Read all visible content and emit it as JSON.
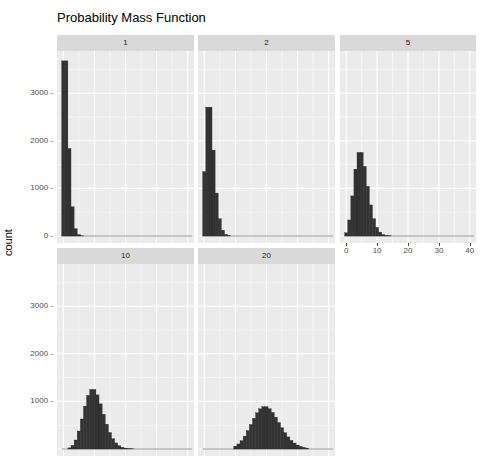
{
  "chart_data": {
    "type": "bar",
    "title": "Probability Mass Function",
    "xlabel": "",
    "ylabel": "count",
    "facets": [
      "1",
      "2",
      "5",
      "10",
      "20"
    ],
    "ylim": [
      0,
      3900
    ],
    "y_ticks": [
      0,
      1000,
      2000,
      3000
    ],
    "xlim": [
      -2,
      42
    ],
    "x_ticks": [
      0,
      10,
      20,
      30,
      40
    ],
    "grid": true,
    "bin_width": 1,
    "series": [
      {
        "name": "1",
        "x": [
          0,
          1,
          2,
          3,
          4,
          5,
          6
        ],
        "values": [
          3679,
          3679,
          1839,
          613,
          153,
          31,
          5
        ]
      },
      {
        "name": "2",
        "x": [
          0,
          1,
          2,
          3,
          4,
          5,
          6,
          7,
          8
        ],
        "values": [
          1353,
          2707,
          2707,
          1804,
          902,
          361,
          120,
          34,
          9
        ]
      },
      {
        "name": "5",
        "x": [
          0,
          1,
          2,
          3,
          4,
          5,
          6,
          7,
          8,
          9,
          10,
          11,
          12,
          13,
          14
        ],
        "values": [
          67,
          337,
          842,
          1404,
          1755,
          1755,
          1462,
          1044,
          653,
          363,
          181,
          82,
          34,
          13,
          5
        ]
      },
      {
        "name": "10",
        "x": [
          2,
          3,
          4,
          5,
          6,
          7,
          8,
          9,
          10,
          11,
          12,
          13,
          14,
          15,
          16,
          17,
          18,
          19,
          20,
          21,
          22
        ],
        "values": [
          23,
          76,
          189,
          378,
          631,
          901,
          1126,
          1251,
          1251,
          1137,
          948,
          729,
          521,
          347,
          217,
          128,
          71,
          37,
          19,
          9,
          4
        ]
      },
      {
        "name": "20",
        "x": [
          10,
          11,
          12,
          13,
          14,
          15,
          16,
          17,
          18,
          19,
          20,
          21,
          22,
          23,
          24,
          25,
          26,
          27,
          28,
          29,
          30,
          31,
          32,
          33
        ],
        "values": [
          58,
          106,
          176,
          271,
          387,
          516,
          646,
          760,
          844,
          888,
          888,
          846,
          769,
          669,
          557,
          446,
          343,
          254,
          181,
          125,
          83,
          54,
          34,
          20
        ]
      }
    ]
  },
  "labels": {
    "title": "Probability Mass Function",
    "ylabel": "count"
  }
}
